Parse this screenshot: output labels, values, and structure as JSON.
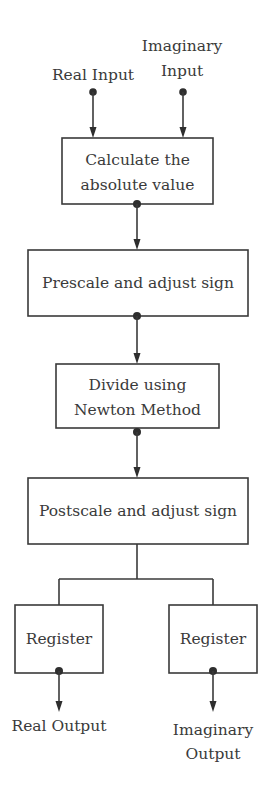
{
  "diagram": {
    "type": "flowchart",
    "colors": {
      "stroke": "#3a3a3a",
      "text": "#3a3a3a",
      "background": "#ffffff"
    },
    "inputs": {
      "real": {
        "label": "Real Input"
      },
      "imaginary": {
        "line1": "Imaginary",
        "line2": "Input"
      }
    },
    "blocks": [
      {
        "line1": "Calculate the",
        "line2": "absolute value"
      },
      {
        "label": "Prescale and adjust sign"
      },
      {
        "line1": "Divide using",
        "line2": "Newton Method"
      },
      {
        "label": "Postscale and adjust sign"
      }
    ],
    "registers": [
      {
        "label": "Register"
      },
      {
        "label": "Register"
      }
    ],
    "outputs": {
      "real": {
        "label": "Real Output"
      },
      "imaginary": {
        "line1": "Imaginary",
        "line2": "Output"
      }
    }
  }
}
